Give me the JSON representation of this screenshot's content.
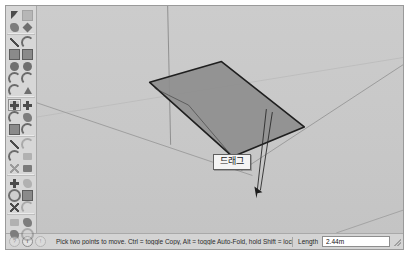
{
  "window": {
    "background": "#d2d2d2",
    "border_color": "#9a9a9a"
  },
  "tool_palette": {
    "name": "Large Tool Set",
    "groups": [
      {
        "name": "principal",
        "tools": [
          {
            "label": "Select",
            "icon": "arrow-select-icon",
            "shape": "g-arrow",
            "active": false
          },
          {
            "label": "Make Component",
            "icon": "make-component-icon",
            "shape": "g-square",
            "active": false,
            "faint": true
          },
          {
            "label": "Paint Bucket",
            "icon": "paint-bucket-icon",
            "shape": "g-blob",
            "active": false
          },
          {
            "label": "Eraser",
            "icon": "eraser-icon",
            "shape": "g-diamond",
            "active": false
          }
        ]
      },
      {
        "name": "drawing",
        "tools": [
          {
            "label": "Line",
            "icon": "line-icon",
            "shape": "g-line",
            "active": false
          },
          {
            "label": "Freehand",
            "icon": "freehand-icon",
            "shape": "g-arc",
            "active": false
          },
          {
            "label": "Rectangle",
            "icon": "rectangle-icon",
            "shape": "g-square",
            "active": false
          },
          {
            "label": "Rotated Rectangle",
            "icon": "rotated-rectangle-icon",
            "shape": "g-square",
            "active": false
          },
          {
            "label": "Circle",
            "icon": "circle-icon",
            "shape": "g-circle",
            "active": false
          },
          {
            "label": "Polygon",
            "icon": "polygon-icon",
            "shape": "g-circle",
            "active": false
          },
          {
            "label": "Arc",
            "icon": "arc-icon",
            "shape": "g-arc",
            "active": false
          },
          {
            "label": "2 Point Arc",
            "icon": "two-point-arc-icon",
            "shape": "g-arc",
            "active": false
          },
          {
            "label": "3 Point Arc",
            "icon": "three-point-arc-icon",
            "shape": "g-arc",
            "active": false
          },
          {
            "label": "Pie",
            "icon": "pie-icon",
            "shape": "g-tri",
            "active": false
          }
        ]
      },
      {
        "name": "modification",
        "tools": [
          {
            "label": "Move",
            "icon": "move-icon",
            "shape": "g-cross",
            "active": true
          },
          {
            "label": "Push/Pull",
            "icon": "push-pull-icon",
            "shape": "g-cross",
            "active": false
          },
          {
            "label": "Rotate",
            "icon": "rotate-icon",
            "shape": "g-arc",
            "active": false
          },
          {
            "label": "Follow Me",
            "icon": "follow-me-icon",
            "shape": "g-blob",
            "active": false
          },
          {
            "label": "Scale",
            "icon": "scale-icon",
            "shape": "g-square",
            "active": false
          },
          {
            "label": "Offset",
            "icon": "offset-icon",
            "shape": "g-arc",
            "active": false
          }
        ]
      },
      {
        "name": "construction",
        "tools": [
          {
            "label": "Tape Measure",
            "icon": "tape-measure-icon",
            "shape": "g-line",
            "active": false
          },
          {
            "label": "Dimension",
            "icon": "dimension-icon",
            "shape": "g-arc",
            "active": false,
            "faint": true
          },
          {
            "label": "Protractor",
            "icon": "protractor-icon",
            "shape": "g-arc",
            "active": false
          },
          {
            "label": "Text",
            "icon": "text-label-icon",
            "shape": "g-bar",
            "active": false,
            "faint": true
          },
          {
            "label": "Axes",
            "icon": "axes-icon",
            "shape": "g-x",
            "active": false,
            "faint": true
          },
          {
            "label": "3D Text",
            "icon": "three-d-text-icon",
            "shape": "g-bar",
            "active": false
          }
        ]
      },
      {
        "name": "camera",
        "tools": [
          {
            "label": "Orbit",
            "icon": "orbit-icon",
            "shape": "g-cross",
            "active": false
          },
          {
            "label": "Pan",
            "icon": "pan-icon",
            "shape": "g-blob",
            "active": false,
            "faint": true
          },
          {
            "label": "Zoom",
            "icon": "zoom-icon",
            "shape": "g-ring",
            "active": false
          },
          {
            "label": "Zoom Window",
            "icon": "zoom-window-icon",
            "shape": "g-square",
            "active": false
          },
          {
            "label": "Zoom Extents",
            "icon": "zoom-extents-icon",
            "shape": "g-x",
            "active": false
          },
          {
            "label": "Previous View",
            "icon": "previous-view-icon",
            "shape": "g-arc",
            "active": false,
            "faint": true
          }
        ]
      },
      {
        "name": "walkthrough",
        "tools": [
          {
            "label": "Position Camera",
            "icon": "position-camera-icon",
            "shape": "g-bar",
            "active": false,
            "faint": true
          },
          {
            "label": "Look Around",
            "icon": "look-around-icon",
            "shape": "g-blob",
            "active": false
          },
          {
            "label": "Walk",
            "icon": "walk-icon",
            "shape": "g-blob",
            "active": false
          },
          {
            "label": "Section Plane",
            "icon": "section-plane-icon",
            "shape": "g-ring",
            "active": false,
            "faint": true
          }
        ]
      }
    ]
  },
  "viewport": {
    "background": "#c9c9c9",
    "face_fill": "#8f8f8f",
    "edge_color": "#1c1c1c",
    "axis_color": "#9d9d9d",
    "horizon_color": "#b9b9b9",
    "selection": {
      "shape": "rectangle-face",
      "state": "being-moved"
    },
    "tooltip": {
      "text": "드래그"
    }
  },
  "status_bar": {
    "icons": [
      {
        "name": "context-help-icon",
        "glyph": "?",
        "dim": true
      },
      {
        "name": "info-icon",
        "glyph": "i",
        "dim": false
      },
      {
        "name": "warning-icon",
        "glyph": "!",
        "dim": true
      }
    ],
    "message": "Pick two points to move.  Ctrl = toggle Copy, Alt = toggle Auto-Fold, hold Shift = lock inference.",
    "measurement": {
      "label": "Length",
      "value": "2.44m",
      "placeholder": "Length"
    }
  }
}
